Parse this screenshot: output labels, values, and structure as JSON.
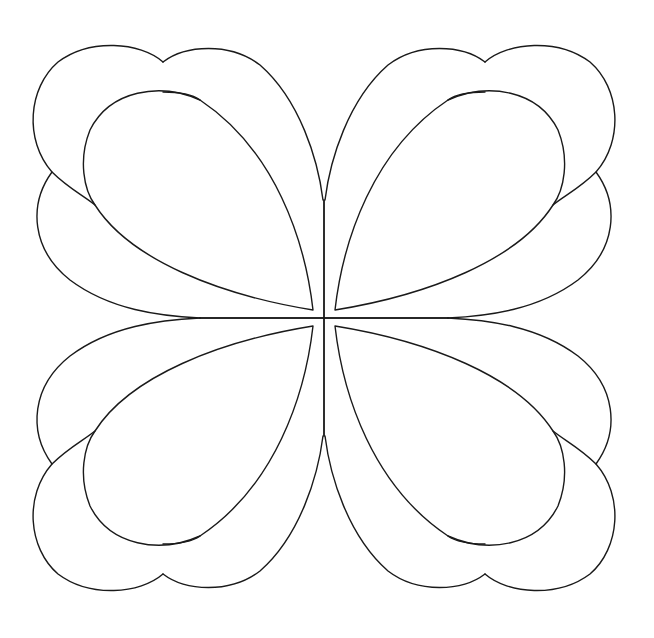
{
  "artwork": {
    "subject": "four-leaf quilting pattern",
    "style": "black outline line drawing",
    "background_color": "#ffffff",
    "line_color": "#1a1a1a",
    "center": [
      324,
      318
    ],
    "quadrants": [
      "top-left",
      "top-right",
      "bottom-left",
      "bottom-right"
    ],
    "petals_per_quadrant": 4
  }
}
